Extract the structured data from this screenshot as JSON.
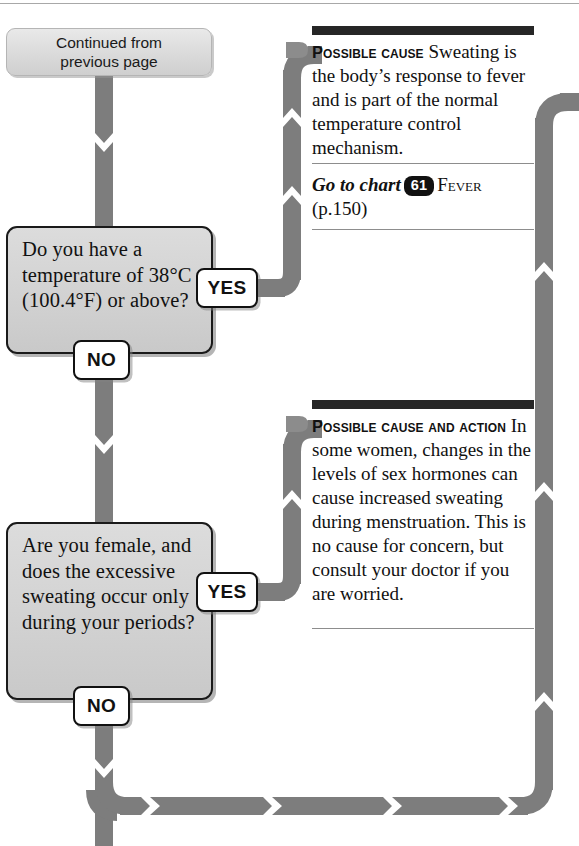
{
  "page": {
    "width": 579,
    "height": 846,
    "colors": {
      "flow_line": "#7d7d7d",
      "box_fill": "#d4d4d4",
      "box_border": "#1a1a1a",
      "rule_bar": "#262626",
      "badge": "#111111",
      "page_background": "#ffffff"
    }
  },
  "continued": {
    "line1": "Continued from",
    "line2": "previous page"
  },
  "questions": [
    {
      "id": "q-temperature",
      "text": "Do you have a temperature of 38°C (100.4°F) or above?",
      "yes_label": "YES",
      "no_label": "NO"
    },
    {
      "id": "q-periods",
      "text": "Are you female, and does the excessive sweating occur only during your periods?",
      "yes_label": "YES",
      "no_label": "NO"
    }
  ],
  "advice": [
    {
      "id": "advice-fever",
      "lead": "Possible cause",
      "body": " Sweating is the body’s response to fever and is part of the normal temperature control mechanism.",
      "action": {
        "prefix": "Go to chart",
        "chart_number": "61",
        "chart_name": "Fever",
        "page_ref": "(p.150)"
      }
    },
    {
      "id": "advice-menstruation",
      "lead": "Possible cause and action",
      "body": " In some women, changes in the levels of sex hormones can cause increased sweating during menstruation. This is no cause for concern, but consult your doctor if you are worried.",
      "action": null
    }
  ]
}
